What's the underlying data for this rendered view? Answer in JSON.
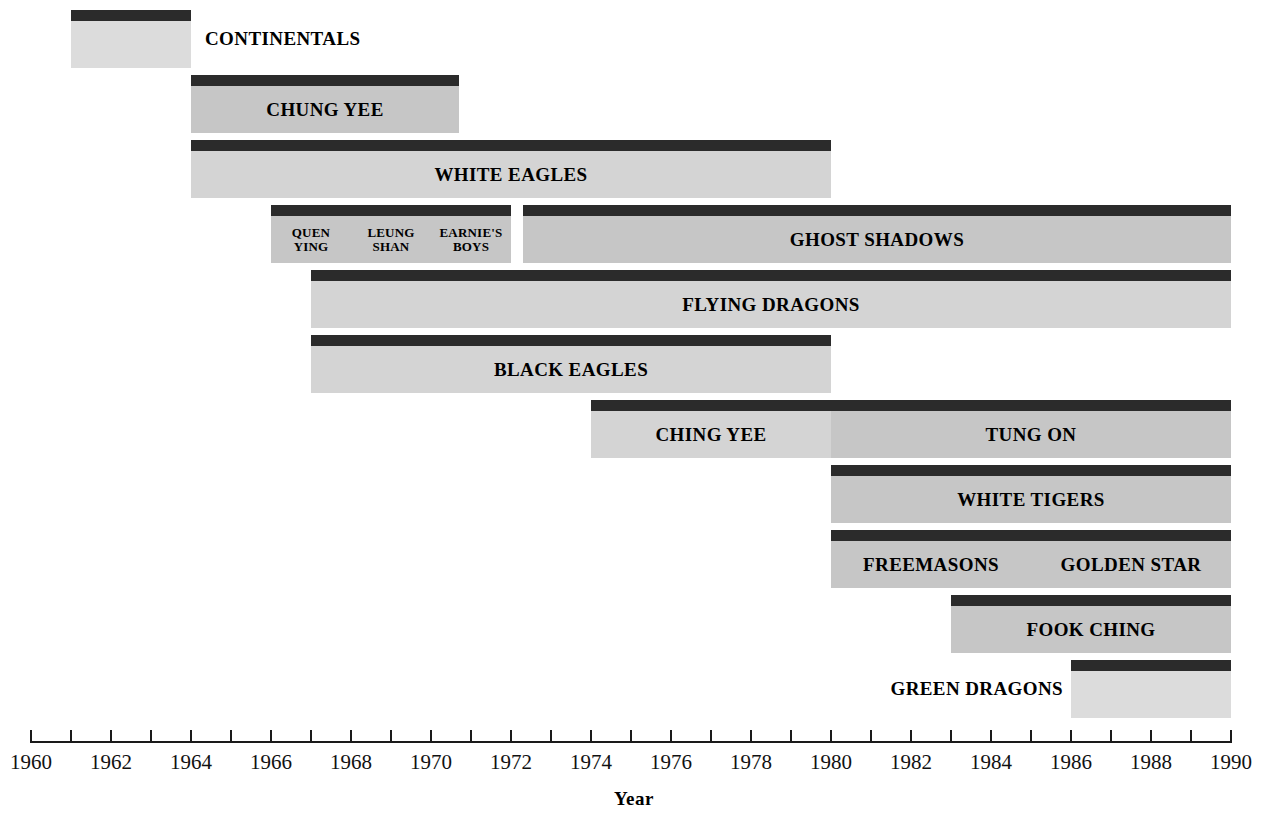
{
  "chart_data": {
    "type": "bar",
    "title": "",
    "subtitle": "",
    "xlabel": "Year",
    "ylabel": "",
    "xlim": [
      1960,
      1990
    ],
    "x_tick_step": 1,
    "x_label_step": 2,
    "grid": false,
    "legend": "none",
    "orientation": "horizontal-timeline",
    "x_tick_labels": [
      "1960",
      "1962",
      "1964",
      "1966",
      "1968",
      "1970",
      "1972",
      "1974",
      "1976",
      "1978",
      "1980",
      "1982",
      "1984",
      "1986",
      "1988",
      "1990"
    ],
    "x_tick_values": [
      1960,
      1962,
      1964,
      1966,
      1968,
      1970,
      1972,
      1974,
      1976,
      1978,
      1980,
      1982,
      1984,
      1986,
      1988,
      1990
    ],
    "colors": {
      "bar_cap": "#2b2b2b",
      "bar_body": "#c6c6c6",
      "bar_body_light": "#d4d4d4",
      "bar_body_lighter": "#dcdcdc",
      "axis": "#1a1a1a",
      "text": "#000000",
      "background": "#ffffff"
    },
    "rows": [
      {
        "row": 0,
        "segments": [
          {
            "label": "CONTINENTALS",
            "start": 1961,
            "end": 1964,
            "label_position": "outside-right",
            "shade": "lighter"
          }
        ]
      },
      {
        "row": 1,
        "segments": [
          {
            "label": "CHUNG YEE",
            "start": 1964,
            "end": 1970.7,
            "label_position": "inside",
            "shade": "normal"
          }
        ]
      },
      {
        "row": 2,
        "segments": [
          {
            "label": "WHITE EAGLES",
            "start": 1964,
            "end": 1980,
            "label_position": "inside",
            "shade": "light"
          }
        ]
      },
      {
        "row": 3,
        "segments": [
          {
            "label": "QUEN YING",
            "start": 1966,
            "end": 1968,
            "label_position": "inside",
            "shade": "normal",
            "small": true
          },
          {
            "label": "LEUNG SHAN",
            "start": 1968,
            "end": 1970,
            "label_position": "inside",
            "shade": "normal",
            "small": true
          },
          {
            "label": "EARNIE'S BOYS",
            "start": 1970,
            "end": 1972,
            "label_position": "inside",
            "shade": "normal",
            "small": true
          },
          {
            "label": "GHOST SHADOWS",
            "start": 1972.3,
            "end": 1990,
            "label_position": "inside",
            "shade": "normal"
          }
        ]
      },
      {
        "row": 4,
        "segments": [
          {
            "label": "FLYING DRAGONS",
            "start": 1967,
            "end": 1990,
            "label_position": "inside",
            "shade": "light"
          }
        ]
      },
      {
        "row": 5,
        "segments": [
          {
            "label": "BLACK EAGLES",
            "start": 1967,
            "end": 1980,
            "label_position": "inside",
            "shade": "light"
          }
        ]
      },
      {
        "row": 6,
        "segments": [
          {
            "label": "CHING YEE",
            "start": 1974,
            "end": 1980,
            "label_position": "inside",
            "shade": "light"
          },
          {
            "label": "TUNG ON",
            "start": 1980,
            "end": 1990,
            "label_position": "inside",
            "shade": "normal"
          }
        ]
      },
      {
        "row": 7,
        "segments": [
          {
            "label": "WHITE TIGERS",
            "start": 1980,
            "end": 1990,
            "label_position": "inside",
            "shade": "normal"
          }
        ]
      },
      {
        "row": 8,
        "segments": [
          {
            "label": "FREEMASONS",
            "start": 1980,
            "end": 1985,
            "label_position": "inside",
            "shade": "normal"
          },
          {
            "label": "GOLDEN STAR",
            "start": 1985,
            "end": 1990,
            "label_position": "inside",
            "shade": "normal"
          }
        ]
      },
      {
        "row": 9,
        "segments": [
          {
            "label": "FOOK CHING",
            "start": 1983,
            "end": 1990,
            "label_position": "inside",
            "shade": "normal"
          }
        ]
      },
      {
        "row": 10,
        "segments": [
          {
            "label": "GREEN DRAGONS",
            "start": 1986,
            "end": 1990,
            "label_position": "outside-left",
            "shade": "lighter"
          }
        ]
      }
    ]
  }
}
